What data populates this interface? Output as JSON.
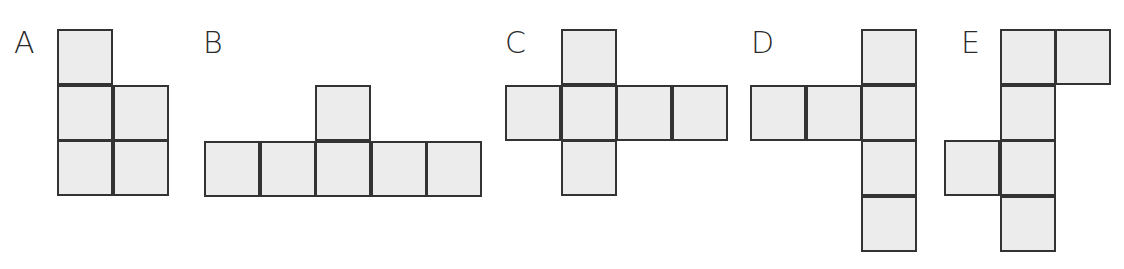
{
  "figure": {
    "colors": {
      "fill": "#ececec",
      "stroke": "#333333",
      "label": "#2a2a2a"
    },
    "cell_size": 55.5,
    "nets": [
      {
        "label": "A",
        "label_pos": [
          14,
          28
        ],
        "origin": [
          57,
          29
        ],
        "cells": [
          [
            0,
            0
          ],
          [
            0,
            1
          ],
          [
            1,
            1
          ],
          [
            0,
            2
          ],
          [
            1,
            2
          ]
        ]
      },
      {
        "label": "B",
        "label_pos": [
          203,
          28
        ],
        "origin": [
          204,
          85
        ],
        "cells": [
          [
            2,
            0
          ],
          [
            0,
            1
          ],
          [
            1,
            1
          ],
          [
            2,
            1
          ],
          [
            3,
            1
          ],
          [
            4,
            1
          ]
        ]
      },
      {
        "label": "C",
        "label_pos": [
          505,
          28
        ],
        "origin": [
          505,
          29
        ],
        "cells": [
          [
            1,
            0
          ],
          [
            0,
            1
          ],
          [
            1,
            1
          ],
          [
            2,
            1
          ],
          [
            3,
            1
          ],
          [
            1,
            2
          ]
        ]
      },
      {
        "label": "D",
        "label_pos": [
          751,
          28
        ],
        "origin": [
          750,
          29
        ],
        "cells": [
          [
            2,
            0
          ],
          [
            0,
            1
          ],
          [
            1,
            1
          ],
          [
            2,
            1
          ],
          [
            2,
            2
          ],
          [
            2,
            3
          ]
        ]
      },
      {
        "label": "E",
        "label_pos": [
          961,
          28
        ],
        "origin": [
          944,
          29
        ],
        "cells": [
          [
            1,
            0
          ],
          [
            2,
            0
          ],
          [
            1,
            1
          ],
          [
            0,
            2
          ],
          [
            1,
            2
          ],
          [
            1,
            3
          ]
        ]
      }
    ]
  }
}
